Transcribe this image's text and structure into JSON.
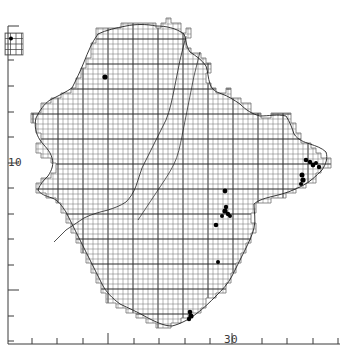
{
  "figure": {
    "kind": "distribution-map",
    "title": "",
    "background_color": "#ffffff",
    "ink_color": "#1a1a1a",
    "grid_color": "#555555",
    "coast_color": "#222222",
    "record_color": "#000000"
  },
  "axes": {
    "y_axis": {
      "label_text": "10",
      "label_x": 8,
      "label_y": 156,
      "spine_x": 8,
      "spine_top": 26,
      "spine_bottom": 344,
      "minor_tick_length": 6,
      "major_tick_length": 11,
      "ticks": [
        {
          "y": 26,
          "major": true
        },
        {
          "y": 60,
          "major": false
        },
        {
          "y": 86,
          "major": false
        },
        {
          "y": 112,
          "major": false
        },
        {
          "y": 137,
          "major": false
        },
        {
          "y": 163,
          "major": true
        },
        {
          "y": 188,
          "major": false
        },
        {
          "y": 214,
          "major": false
        },
        {
          "y": 239,
          "major": false
        },
        {
          "y": 265,
          "major": false
        },
        {
          "y": 290,
          "major": true
        },
        {
          "y": 316,
          "major": false
        },
        {
          "y": 341,
          "major": false
        }
      ]
    },
    "x_axis": {
      "label_text": "30",
      "label_x": 224,
      "label_y": 333,
      "spine_y": 344,
      "spine_left": 8,
      "spine_right": 340,
      "minor_tick_length": 6,
      "major_tick_length": 11,
      "ticks": [
        {
          "x": 32,
          "major": false
        },
        {
          "x": 57,
          "major": false
        },
        {
          "x": 83,
          "major": false
        },
        {
          "x": 108,
          "major": true
        },
        {
          "x": 134,
          "major": false
        },
        {
          "x": 159,
          "major": false
        },
        {
          "x": 185,
          "major": false
        },
        {
          "x": 210,
          "major": false
        },
        {
          "x": 232,
          "major": true
        },
        {
          "x": 262,
          "major": false
        },
        {
          "x": 287,
          "major": false
        },
        {
          "x": 313,
          "major": false
        },
        {
          "x": 338,
          "major": false
        }
      ]
    }
  },
  "inset": {
    "name": "offshore-island-inset",
    "x": 5,
    "y": 33,
    "width": 18,
    "height": 22,
    "cell": 5.5,
    "cols": 3,
    "rows": 4,
    "records": [
      {
        "x": 11.0,
        "y": 38.5
      }
    ]
  },
  "grid": {
    "cell_size": 5.0,
    "major_every": 5,
    "origin_x": 8,
    "origin_y": 14,
    "minor_width": 0.5,
    "major_width": 1.0
  },
  "county_outline": "M 96,33 L 96,28 L 121,28 L 121,23 L 156,23 L 156,28 L 161,28 L 161,23 L 166,23 L 166,18 L 171,18 L 171,23 L 181,23 L 181,33 L 186,33 L 186,28 L 191,28 L 191,38 L 186,38 L 186,48 L 191,48 L 191,53 L 201,53 L 201,58 L 206,58 L 206,63 L 211,63 L 211,73 L 206,73 L 206,83 L 211,83 L 211,88 L 216,88 L 216,93 L 226,93 L 226,88 L 231,88 L 231,98 L 241,98 L 241,103 L 251,103 L 251,113 L 261,113 L 261,118 L 271,118 L 271,113 L 291,113 L 291,123 L 296,123 L 296,133 L 301,133 L 301,143 L 311,143 L 311,148 L 316,148 L 316,153 L 321,153 L 321,158 L 331,158 L 331,168 L 321,168 L 321,173 L 316,173 L 316,183 L 306,183 L 306,188 L 296,188 L 296,193 L 286,193 L 286,198 L 271,198 L 271,203 L 256,203 L 256,213 L 251,213 L 251,223 L 256,223 L 256,233 L 251,233 L 251,243 L 246,243 L 246,253 L 241,253 L 241,263 L 236,263 L 236,273 L 231,273 L 231,283 L 226,283 L 226,293 L 216,293 L 216,298 L 206,298 L 206,308 L 201,308 L 201,313 L 191,313 L 191,318 L 181,318 L 181,323 L 171,323 L 171,328 L 156,328 L 156,323 L 146,323 L 146,318 L 136,318 L 136,313 L 126,313 L 126,308 L 116,308 L 116,303 L 106,303 L 106,293 L 101,293 L 101,283 L 96,283 L 96,273 L 91,273 L 91,263 L 86,263 L 86,253 L 81,253 L 81,243 L 76,243 L 76,233 L 71,233 L 71,223 L 66,223 L 66,213 L 61,213 L 61,203 L 56,203 L 56,198 L 46,198 L 46,193 L 36,193 L 36,183 L 41,183 L 41,178 L 51,178 L 51,173 L 56,173 L 56,163 L 51,163 L 51,158 L 41,158 L 41,153 L 36,153 L 36,143 L 41,143 L 41,133 L 36,133 L 36,123 L 31,123 L 31,113 L 41,113 L 41,103 L 51,103 L 51,98 L 61,98 L 61,93 L 71,93 L 71,88 L 76,88 L 76,78 L 81,78 L 81,68 L 86,68 L 86,58 L 91,58 L 91,43 L 96,43 Z",
  "coastline": "M 98,34 C 92,42 88,52 84,62 C 80,72 76,80 72,88 C 66,92 58,96 50,100 C 44,104 40,110 36,118 C 34,126 36,134 40,140 C 44,146 50,150 52,158 C 54,164 52,170 48,176 C 44,180 40,184 38,190 C 40,194 46,196 52,198 C 58,200 62,206 66,212 C 70,220 74,228 78,236 C 82,244 86,252 90,260 C 94,268 98,276 102,284 C 106,292 112,298 120,304 C 128,308 138,312 148,318 C 156,322 164,326 172,326 C 180,324 188,320 196,314 C 204,308 210,302 216,296 C 222,290 228,284 232,276 C 236,268 240,260 244,252 C 248,244 252,236 254,228 C 256,220 254,212 254,204 C 258,200 266,198 274,196 C 284,194 294,190 302,186 C 310,182 316,176 322,170 C 326,164 328,158 326,152 C 322,148 316,146 310,144 C 304,142 298,140 294,134 C 292,128 290,122 286,116 C 278,114 268,116 260,116 C 252,114 246,110 240,104 C 234,100 228,96 222,94 C 216,92 212,90 210,84 C 208,78 208,72 206,66 C 202,60 196,56 190,52 C 186,46 186,40 184,34 C 176,28 166,26 156,26 C 146,24 136,24 126,26 C 116,28 106,30 98,34 Z",
  "inner_boundary": "M 186,36 C 184,44 182,52 180,60 C 178,70 176,80 174,90 C 172,100 170,110 166,120 C 162,128 158,136 154,144 C 150,152 146,160 142,168 C 140,174 138,180 136,186 C 134,192 130,198 126,202 C 120,206 114,208 108,210 C 100,212 92,214 84,218 C 78,222 72,226 66,230 C 62,234 58,238 54,242",
  "river_path": "M 200,52 C 198,60 196,68 194,76 C 192,86 190,96 188,106 C 186,116 184,126 182,136 C 180,146 178,156 174,164 C 170,172 166,178 162,184 C 158,190 154,196 150,202 C 146,208 142,214 138,220",
  "records": [
    {
      "id": "rec-nw-1",
      "x": 105,
      "y": 77,
      "r": 2.6
    },
    {
      "id": "rec-ce-1",
      "x": 225,
      "y": 191,
      "r": 2.4
    },
    {
      "id": "rec-ce-2",
      "x": 226,
      "y": 207,
      "r": 2.2
    },
    {
      "id": "rec-ce-3",
      "x": 225,
      "y": 211,
      "r": 2.6
    },
    {
      "id": "rec-ce-4",
      "x": 228,
      "y": 214,
      "r": 2.2
    },
    {
      "id": "rec-ce-5",
      "x": 230,
      "y": 216,
      "r": 2.0
    },
    {
      "id": "rec-ce-6",
      "x": 222,
      "y": 216,
      "r": 2.0
    },
    {
      "id": "rec-ce-7",
      "x": 216,
      "y": 225,
      "r": 2.3
    },
    {
      "id": "rec-e-1",
      "x": 306,
      "y": 160,
      "r": 2.3
    },
    {
      "id": "rec-e-2",
      "x": 310,
      "y": 162,
      "r": 2.2
    },
    {
      "id": "rec-e-3",
      "x": 313,
      "y": 165,
      "r": 2.4
    },
    {
      "id": "rec-e-4",
      "x": 316,
      "y": 163,
      "r": 2.0
    },
    {
      "id": "rec-e-5",
      "x": 319,
      "y": 167,
      "r": 2.2
    },
    {
      "id": "rec-e-6",
      "x": 302,
      "y": 175,
      "r": 2.5
    },
    {
      "id": "rec-e-7",
      "x": 303,
      "y": 180,
      "r": 2.6
    },
    {
      "id": "rec-e-8",
      "x": 301,
      "y": 184,
      "r": 2.1
    },
    {
      "id": "rec-s-1",
      "x": 190,
      "y": 312,
      "r": 2.3
    },
    {
      "id": "rec-s-2",
      "x": 191,
      "y": 316,
      "r": 2.6
    },
    {
      "id": "rec-s-3",
      "x": 189,
      "y": 319,
      "r": 2.2
    },
    {
      "id": "rec-se-1",
      "x": 218,
      "y": 262,
      "r": 2.0
    }
  ],
  "chart_data": {
    "type": "scatter",
    "title": "",
    "xlabel": "",
    "ylabel": "",
    "x_tick_labels": [
      "30"
    ],
    "y_tick_labels": [
      "10"
    ],
    "grid": true,
    "legend": "none",
    "series": [
      {
        "name": "records",
        "marker": "filled-square-dot",
        "points": [
          [
            105,
            77
          ],
          [
            225,
            191
          ],
          [
            226,
            207
          ],
          [
            225,
            211
          ],
          [
            228,
            214
          ],
          [
            230,
            216
          ],
          [
            222,
            216
          ],
          [
            216,
            225
          ],
          [
            306,
            160
          ],
          [
            310,
            162
          ],
          [
            313,
            165
          ],
          [
            316,
            163
          ],
          [
            319,
            167
          ],
          [
            302,
            175
          ],
          [
            303,
            180
          ],
          [
            301,
            184
          ],
          [
            190,
            312
          ],
          [
            191,
            316
          ],
          [
            189,
            319
          ],
          [
            218,
            262
          ],
          [
            11,
            38
          ]
        ]
      }
    ]
  }
}
